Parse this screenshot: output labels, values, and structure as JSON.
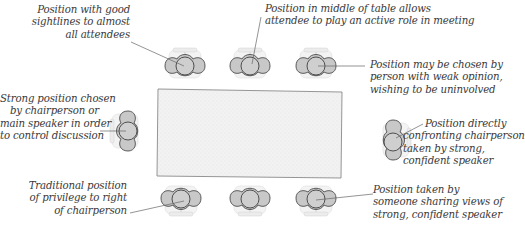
{
  "colors": {
    "table_fill": "#f1f1f1",
    "table_stroke": "#8a8a8a",
    "chair_fill": "#c9c9c9",
    "chair_back": "#ececec",
    "chair_stroke": "#555555",
    "leader_line": "#666666",
    "text": "#3a3a3a"
  },
  "annotations": [
    {
      "id": "good-sightlines",
      "lines": [
        "Position with good",
        "sightlines to almost",
        "all attendees"
      ],
      "target_seat": "top-left"
    },
    {
      "id": "middle-of-table",
      "lines": [
        "Position in middle of table allows",
        "attendee to play an active role in meeting"
      ],
      "target_seat": "top-middle"
    },
    {
      "id": "weak-opinion",
      "lines": [
        "Position may be chosen by",
        "person with weak opinion,",
        "wishing to be uninvolved"
      ],
      "target_seat": "top-right"
    },
    {
      "id": "chairperson",
      "lines": [
        "Strong position chosen",
        "by chairperson or",
        "main speaker in order",
        "to control discussion"
      ],
      "target_seat": "head-left"
    },
    {
      "id": "confronting",
      "lines": [
        "Position directly",
        "confronting chairperson",
        "taken by strong,",
        "confident speaker"
      ],
      "target_seat": "head-right"
    },
    {
      "id": "privilege",
      "lines": [
        "Traditional position",
        "of privilege to right",
        "of chairperson"
      ],
      "target_seat": "bottom-left"
    },
    {
      "id": "sharing-views",
      "lines": [
        "Position taken by",
        "someone sharing views of",
        "strong, confident speaker"
      ],
      "target_seat": "bottom-right"
    }
  ],
  "seats": [
    {
      "id": "top-left",
      "side": "top"
    },
    {
      "id": "top-middle",
      "side": "top"
    },
    {
      "id": "top-right",
      "side": "top"
    },
    {
      "id": "head-left",
      "side": "left"
    },
    {
      "id": "head-right",
      "side": "right"
    },
    {
      "id": "bottom-left",
      "side": "bottom"
    },
    {
      "id": "bottom-middle",
      "side": "bottom"
    },
    {
      "id": "bottom-right",
      "side": "bottom"
    }
  ]
}
